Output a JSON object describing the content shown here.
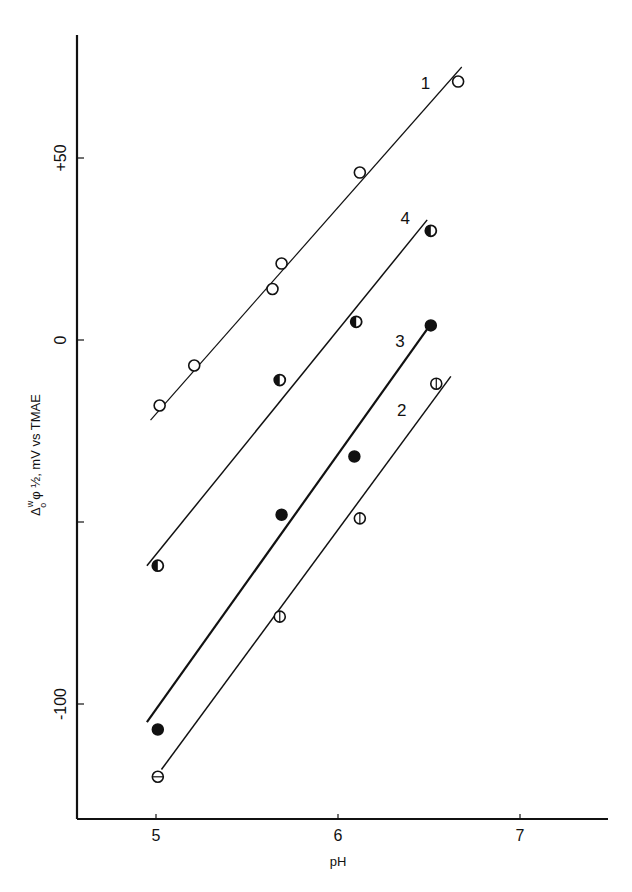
{
  "chart_data": {
    "type": "scatter",
    "title": "",
    "xlabel": "pH",
    "ylabel": "Δ_o^w φ ½, mV vs TMAE",
    "ylabel_parts": {
      "delta": "Δ",
      "sup": "w",
      "sub": "o",
      "rest": "φ ½, mV vs TMAE"
    },
    "xlim": [
      4.56,
      7.48
    ],
    "ylim": [
      -131.6,
      83.8
    ],
    "xticks": [
      5,
      6,
      7
    ],
    "xtick_labels": [
      "5",
      "6",
      "7"
    ],
    "yticks": [
      50,
      0,
      -50,
      -100
    ],
    "ytick_labels": [
      "+50",
      "0",
      "",
      "-100"
    ],
    "grid": false,
    "legend": "none (series labeled inline 1–4)",
    "series": [
      {
        "name": "1",
        "marker": "open-circle",
        "line_weight": "thin",
        "x": [
          5.02,
          5.21,
          5.64,
          5.69,
          6.12,
          6.66
        ],
        "y": [
          -18,
          -7,
          14,
          21,
          46,
          71
        ],
        "fit_line": {
          "x": [
            4.97,
            6.68
          ],
          "y": [
            -22,
            75
          ]
        },
        "label_pos": {
          "x": 6.48,
          "y": 69
        }
      },
      {
        "name": "4",
        "marker": "half-filled-circle",
        "line_weight": "medium",
        "x": [
          5.01,
          5.68,
          6.1,
          6.51
        ],
        "y": [
          -62,
          -11,
          5,
          30
        ],
        "fit_line": {
          "x": [
            4.95,
            6.49
          ],
          "y": [
            -62,
            33
          ]
        },
        "label_pos": {
          "x": 6.37,
          "y": 32
        }
      },
      {
        "name": "3",
        "marker": "filled-circle",
        "line_weight": "thick",
        "x": [
          5.01,
          5.69,
          6.09,
          6.51
        ],
        "y": [
          -107,
          -48,
          -32,
          4
        ],
        "fit_line": {
          "x": [
            4.95,
            6.49
          ],
          "y": [
            -105,
            3
          ]
        },
        "label_pos": {
          "x": 6.34,
          "y": -2
        }
      },
      {
        "name": "2",
        "marker": "barred-circle",
        "line_weight": "medium",
        "x": [
          5.01,
          5.68,
          6.12,
          6.54
        ],
        "y": [
          -120,
          -76,
          -49,
          -12
        ],
        "fit_line": {
          "x": [
            5.03,
            6.62
          ],
          "y": [
            -118,
            -10
          ]
        },
        "label_pos": {
          "x": 6.35,
          "y": -21
        }
      }
    ]
  },
  "axes": {
    "x_title": "pH",
    "y_title_rest": "φ ½, mV vs TMAE"
  }
}
